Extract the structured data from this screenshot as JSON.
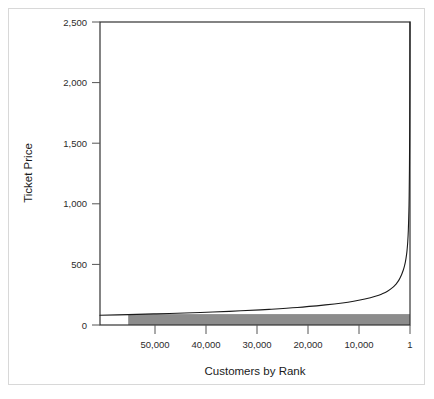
{
  "figure": {
    "frame_color": "#d8d8d8",
    "background": "#ffffff"
  },
  "chart_data": {
    "type": "line",
    "title": "",
    "subtitle": "",
    "xlabel": "Customers by Rank",
    "ylabel": "Ticket Price",
    "x_is_reversed": true,
    "xlim": [
      55000,
      1
    ],
    "ylim": [
      0,
      2500
    ],
    "grid": false,
    "legend": null,
    "x_tick_labels": [
      "50,000",
      "40,000",
      "30,000",
      "20,000",
      "10,000",
      "1"
    ],
    "x_tick_values": [
      50000,
      40000,
      30000,
      20000,
      10000,
      1
    ],
    "y_tick_labels": [
      "0",
      "500",
      "1,000",
      "1,500",
      "2,000",
      "2,500"
    ],
    "y_tick_values": [
      0,
      500,
      1000,
      1500,
      2000,
      2500
    ],
    "series": [
      {
        "name": "Ticket Price by customer rank",
        "type": "line",
        "color": "#1a1a1a",
        "x": [
          55000,
          50000,
          45000,
          40000,
          35000,
          30000,
          25000,
          20000,
          15000,
          12000,
          10000,
          8000,
          6000,
          5000,
          4000,
          3000,
          2500,
          2000,
          1500,
          1200,
          1000,
          800,
          600,
          500,
          400,
          300,
          200,
          150,
          100,
          60,
          30,
          10,
          5,
          2,
          1
        ],
        "y": [
          80,
          86,
          92,
          99,
          107,
          117,
          129,
          144,
          166,
          182,
          196,
          214,
          239,
          256,
          278,
          312,
          336,
          368,
          415,
          452,
          484,
          525,
          585,
          629,
          687,
          778,
          938,
          1065,
          1280,
          1580,
          1950,
          2340,
          2450,
          2495,
          2500
        ]
      }
    ],
    "shaded_region": {
      "name": "low-price customer band",
      "color": "#8c8c8c",
      "x_from": 50000,
      "x_to": 1,
      "y_from": 0,
      "y_to": 90
    }
  },
  "geometry": {
    "plot_left": 100,
    "plot_right": 410,
    "plot_top": 22,
    "plot_bottom": 325
  }
}
